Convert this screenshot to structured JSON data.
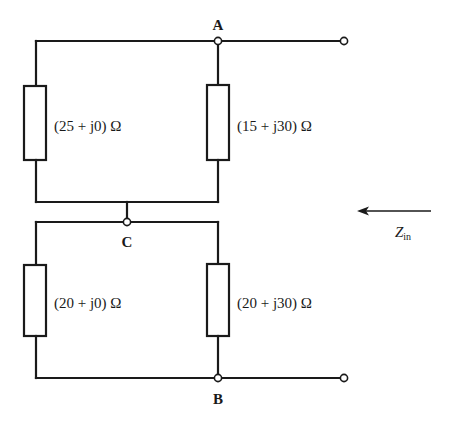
{
  "diagram": {
    "type": "circuit",
    "nodes": {
      "A": "A",
      "B": "B",
      "C": "C"
    },
    "impedances": {
      "upper_left": "(25 + j0) Ω",
      "upper_right": "(15 + j30) Ω",
      "lower_left": "(20 + j0) Ω",
      "lower_right": "(20 + j30) Ω"
    },
    "input_impedance": {
      "symbol": "Z",
      "subscript": "in",
      "arrow_direction": "left"
    },
    "colors": {
      "stroke": "#1a1a1a",
      "background": "#ffffff"
    }
  }
}
